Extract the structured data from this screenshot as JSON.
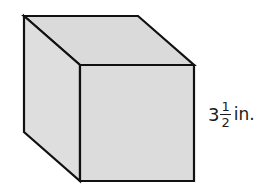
{
  "figure": {
    "shape": "cube",
    "fill_color": "#dcdcdc",
    "stroke_color": "#111111",
    "edge_label": {
      "whole": "3",
      "numerator": "1",
      "denominator": "2",
      "unit": "in.",
      "full_text": "3 1/2 in."
    }
  }
}
